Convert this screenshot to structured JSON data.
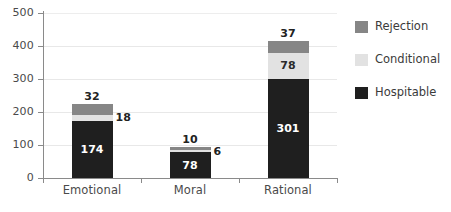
{
  "chart_data": {
    "type": "bar",
    "subtype": "stacked-vertical",
    "title": "",
    "xlabel": "",
    "ylabel": "",
    "categories": [
      "Emotional",
      "Moral",
      "Rational"
    ],
    "series": [
      {
        "name": "Hospitable",
        "values": [
          174,
          78,
          301
        ],
        "color": "#1f1f1f"
      },
      {
        "name": "Conditional",
        "values": [
          18,
          6,
          78
        ],
        "color": "#e2e2e2"
      },
      {
        "name": "Rejection",
        "values": [
          32,
          10,
          37
        ],
        "color": "#868686"
      }
    ],
    "stack_order_bottom_to_top": [
      "Hospitable",
      "Conditional",
      "Rejection"
    ],
    "totals": [
      224,
      94,
      416
    ],
    "ylim": [
      0,
      500
    ],
    "yticks": [
      0,
      100,
      200,
      300,
      400,
      500
    ],
    "ytick_labels": [
      "0",
      "100",
      "200",
      "300",
      "400",
      "500"
    ],
    "grid": true,
    "legend_position": "right",
    "data_labels": {
      "Emotional": {
        "Hospitable": "174",
        "Conditional": "18",
        "Rejection": "32"
      },
      "Moral": {
        "Hospitable": "78",
        "Conditional": "6",
        "Rejection": "10"
      },
      "Rational": {
        "Hospitable": "301",
        "Conditional": "78",
        "Rejection": "37"
      }
    }
  },
  "legend": {
    "items": [
      {
        "label": "Rejection",
        "color": "#868686"
      },
      {
        "label": "Conditional",
        "color": "#e2e2e2"
      },
      {
        "label": "Hospitable",
        "color": "#1f1f1f"
      }
    ]
  },
  "axis": {
    "y_labels": [
      "500",
      "400",
      "300",
      "200",
      "100",
      "0"
    ],
    "x_labels": [
      "Emotional",
      "Moral",
      "Rational"
    ]
  }
}
